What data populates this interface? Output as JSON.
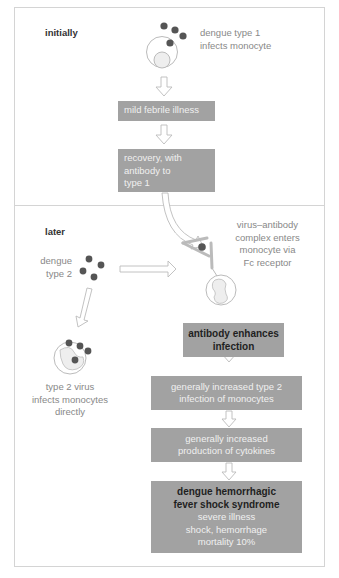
{
  "sections": {
    "initially": {
      "heading": "initially",
      "caption_line1": "dengue type 1",
      "caption_line2": "infects monocyte",
      "box1": "mild febrile illness",
      "box2_line1": "recovery, with",
      "box2_line2": "antibody to",
      "box2_line3": "type 1"
    },
    "later": {
      "heading": "later",
      "virus_label_line1": "dengue",
      "virus_label_line2": "type 2",
      "complex_caption": [
        "virus–antibody",
        "complex enters",
        "monocyte via",
        "Fc receptor"
      ],
      "direct_caption": [
        "type 2 virus",
        "infects monocytes",
        "directly"
      ],
      "steps": [
        {
          "lines": [
            "antibody enhances",
            "infection"
          ],
          "bold": true
        },
        {
          "lines": [
            "generally increased type 2",
            "infection of monocytes"
          ],
          "bold": false
        },
        {
          "lines": [
            "generally increased",
            "production of cytokines"
          ],
          "bold": false
        }
      ],
      "outcome": {
        "title_line1": "dengue hemorrhagic",
        "title_line2": "fever shock syndrome",
        "detail_line1": "severe illness",
        "detail_line2": "shock, hemorrhage",
        "detail_line3": "mortality 10%"
      }
    }
  },
  "colors": {
    "box_fill": "#a2a2a2",
    "virus": "#555555",
    "frame": "#d4d4d4",
    "caption_text": "#888888"
  }
}
